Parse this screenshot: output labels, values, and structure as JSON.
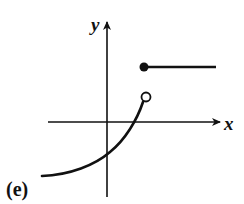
{
  "figure": {
    "panel_label": "(e)",
    "x_axis_label": "x",
    "y_axis_label": "y"
  },
  "colors": {
    "ink": "#111111",
    "background": "#ffffff"
  },
  "geometry": {
    "x_axis": {
      "x1": 48,
      "x2": 216,
      "y": 122
    },
    "y_axis": {
      "x": 107,
      "y1": 197,
      "y2": 26
    },
    "curve": {
      "start": [
        42,
        176
      ],
      "cross_y_axis": [
        107,
        155
      ],
      "cross_x_axis": [
        135,
        122
      ],
      "end": [
        145,
        98
      ]
    },
    "open_circle": {
      "cx": 146,
      "cy": 97,
      "r": 4.5
    },
    "filled_dot": {
      "cx": 144,
      "cy": 67,
      "r": 4.5
    },
    "ray": {
      "x1": 144,
      "x2": 216,
      "y": 67
    }
  }
}
